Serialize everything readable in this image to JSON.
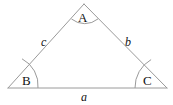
{
  "figure": {
    "stroke_color": "#9a9a9a",
    "text_color": "#111111",
    "background": "#ffffff",
    "width": 173,
    "height": 105
  },
  "vertices": [
    {
      "id": "A",
      "label": "A",
      "x": 84,
      "y": 4,
      "role": "apex-top"
    },
    {
      "id": "B",
      "label": "B",
      "x": 8,
      "y": 88,
      "role": "bottom-left"
    },
    {
      "id": "C",
      "label": "C",
      "x": 167,
      "y": 88,
      "role": "bottom-right"
    }
  ],
  "sides": [
    {
      "id": "a",
      "label": "a",
      "between": "B-C",
      "position": "bottom"
    },
    {
      "id": "b",
      "label": "b",
      "between": "A-C",
      "position": "right"
    },
    {
      "id": "c",
      "label": "c",
      "between": "A-B",
      "position": "left"
    }
  ],
  "angle_arcs": [
    {
      "at": "A",
      "name": "angle-arc-a"
    },
    {
      "at": "B",
      "name": "angle-arc-b"
    },
    {
      "at": "C",
      "name": "angle-arc-c"
    }
  ]
}
